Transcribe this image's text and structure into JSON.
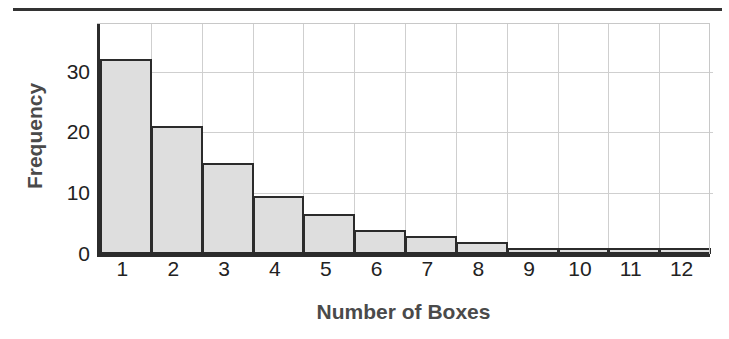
{
  "chart_data": {
    "type": "bar",
    "title": "",
    "xlabel": "Number of Boxes",
    "ylabel": "Frequency",
    "categories": [
      "1",
      "2",
      "3",
      "4",
      "5",
      "6",
      "7",
      "8",
      "9",
      "10",
      "11",
      "12"
    ],
    "values": [
      32,
      21,
      15,
      9.5,
      6.5,
      4,
      3,
      2,
      1,
      1,
      1,
      1
    ],
    "ytick_labels": [
      "0",
      "10",
      "20",
      "30"
    ],
    "ytick_values": [
      0,
      10,
      20,
      30
    ],
    "ylim": [
      0,
      38
    ],
    "xlim": [
      0.5,
      12.5
    ],
    "grid": true,
    "legend": "none",
    "bar_fill_color": "#dedede",
    "bar_edge_color": "#2b2b2b",
    "grid_color": "#cfcfcf",
    "axis_color": "#2b2b2b",
    "label_color": "#4a4a4a"
  },
  "figure": {
    "top_rule": "horizontal-rule"
  }
}
